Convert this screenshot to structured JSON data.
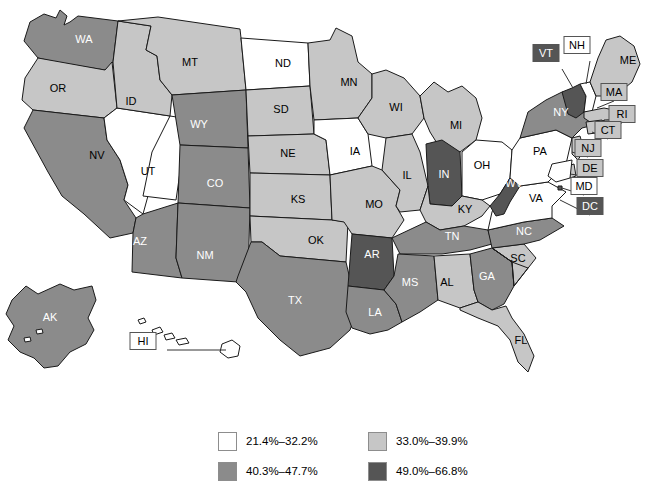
{
  "figure": {
    "type": "choropleth-map",
    "region": "United States"
  },
  "colors": {
    "bin1": "#ffffff",
    "bin2": "#c6c6c6",
    "bin3": "#8b8b8b",
    "bin4": "#555555",
    "outline": "#1a1a1a",
    "background": "#ffffff",
    "callout_border": "#555555",
    "label_dark_text": "#000000",
    "label_light_text": "#ffffff"
  },
  "legend": {
    "items": [
      {
        "label": "21.4%–32.2%",
        "color_key": "bin1",
        "bin": 1
      },
      {
        "label": "33.0%–39.9%",
        "color_key": "bin2",
        "bin": 2
      },
      {
        "label": "40.3%–47.7%",
        "color_key": "bin3",
        "bin": 3
      },
      {
        "label": "49.0%–66.8%",
        "color_key": "bin4",
        "bin": 4
      }
    ]
  },
  "chart_data": {
    "type": "heatmap",
    "title": "",
    "xlabel": "",
    "ylabel": "",
    "legend_position": "bottom",
    "bins": [
      {
        "bin": 1,
        "label": "21.4%–32.2%",
        "min": 21.4,
        "max": 32.2,
        "color": "#ffffff"
      },
      {
        "bin": 2,
        "label": "33.0%–39.9%",
        "min": 33.0,
        "max": 39.9,
        "color": "#c6c6c6"
      },
      {
        "bin": 3,
        "label": "40.3%–47.7%",
        "min": 40.3,
        "max": 47.7,
        "color": "#8b8b8b"
      },
      {
        "bin": 4,
        "label": "49.0%–66.8%",
        "min": 49.0,
        "max": 66.8,
        "color": "#555555"
      }
    ],
    "categories": [
      "WA",
      "OR",
      "CA",
      "NV",
      "ID",
      "MT",
      "WY",
      "UT",
      "AZ",
      "CO",
      "NM",
      "ND",
      "SD",
      "NE",
      "KS",
      "OK",
      "TX",
      "MN",
      "IA",
      "MO",
      "AR",
      "LA",
      "WI",
      "IL",
      "MI",
      "IN",
      "OH",
      "KY",
      "TN",
      "MS",
      "AL",
      "GA",
      "FL",
      "SC",
      "NC",
      "VA",
      "WV",
      "PA",
      "NY",
      "VT",
      "NH",
      "ME",
      "MA",
      "RI",
      "CT",
      "NJ",
      "DE",
      "MD",
      "DC",
      "AK",
      "HI"
    ],
    "values": [
      3,
      2,
      3,
      1,
      2,
      2,
      3,
      1,
      3,
      3,
      3,
      1,
      2,
      2,
      2,
      2,
      3,
      2,
      1,
      2,
      4,
      3,
      2,
      2,
      2,
      4,
      1,
      2,
      3,
      3,
      2,
      3,
      2,
      2,
      3,
      1,
      4,
      1,
      3,
      4,
      1,
      2,
      2,
      2,
      2,
      2,
      2,
      1,
      4,
      3,
      1
    ],
    "states": [
      {
        "code": "WA",
        "bin": 3
      },
      {
        "code": "OR",
        "bin": 2
      },
      {
        "code": "CA",
        "bin": 3
      },
      {
        "code": "NV",
        "bin": 1
      },
      {
        "code": "ID",
        "bin": 2
      },
      {
        "code": "MT",
        "bin": 2
      },
      {
        "code": "WY",
        "bin": 3
      },
      {
        "code": "UT",
        "bin": 1
      },
      {
        "code": "AZ",
        "bin": 3
      },
      {
        "code": "CO",
        "bin": 3
      },
      {
        "code": "NM",
        "bin": 3
      },
      {
        "code": "ND",
        "bin": 1
      },
      {
        "code": "SD",
        "bin": 2
      },
      {
        "code": "NE",
        "bin": 2
      },
      {
        "code": "KS",
        "bin": 2
      },
      {
        "code": "OK",
        "bin": 2
      },
      {
        "code": "TX",
        "bin": 3
      },
      {
        "code": "MN",
        "bin": 2
      },
      {
        "code": "IA",
        "bin": 1
      },
      {
        "code": "MO",
        "bin": 2
      },
      {
        "code": "AR",
        "bin": 4
      },
      {
        "code": "LA",
        "bin": 3
      },
      {
        "code": "WI",
        "bin": 2
      },
      {
        "code": "IL",
        "bin": 2
      },
      {
        "code": "MI",
        "bin": 2
      },
      {
        "code": "IN",
        "bin": 4
      },
      {
        "code": "OH",
        "bin": 1
      },
      {
        "code": "KY",
        "bin": 2
      },
      {
        "code": "TN",
        "bin": 3
      },
      {
        "code": "MS",
        "bin": 3
      },
      {
        "code": "AL",
        "bin": 2
      },
      {
        "code": "GA",
        "bin": 3
      },
      {
        "code": "FL",
        "bin": 2
      },
      {
        "code": "SC",
        "bin": 2
      },
      {
        "code": "NC",
        "bin": 3
      },
      {
        "code": "VA",
        "bin": 1
      },
      {
        "code": "WV",
        "bin": 4
      },
      {
        "code": "PA",
        "bin": 1
      },
      {
        "code": "NY",
        "bin": 3
      },
      {
        "code": "VT",
        "bin": 4
      },
      {
        "code": "NH",
        "bin": 1
      },
      {
        "code": "ME",
        "bin": 2
      },
      {
        "code": "MA",
        "bin": 2
      },
      {
        "code": "RI",
        "bin": 2
      },
      {
        "code": "CT",
        "bin": 2
      },
      {
        "code": "NJ",
        "bin": 2
      },
      {
        "code": "DE",
        "bin": 2
      },
      {
        "code": "MD",
        "bin": 1
      },
      {
        "code": "DC",
        "bin": 4
      },
      {
        "code": "AK",
        "bin": 3
      },
      {
        "code": "HI",
        "bin": 1
      }
    ]
  },
  "map": {
    "inline_labels": [
      {
        "code": "WA",
        "x": 84,
        "y": 40,
        "bin": 3
      },
      {
        "code": "OR",
        "x": 58,
        "y": 89,
        "bin": 2
      },
      {
        "code": "ID",
        "x": 131,
        "y": 102,
        "bin": 2
      },
      {
        "code": "CA",
        "x": 47,
        "y": 186,
        "bin": 3
      },
      {
        "code": "NV",
        "x": 97,
        "y": 156,
        "bin": 1
      },
      {
        "code": "UT",
        "x": 148,
        "y": 172,
        "bin": 1
      },
      {
        "code": "MT",
        "x": 190,
        "y": 63,
        "bin": 2
      },
      {
        "code": "WY",
        "x": 199,
        "y": 125,
        "bin": 3
      },
      {
        "code": "CO",
        "x": 215,
        "y": 184,
        "bin": 3
      },
      {
        "code": "AZ",
        "x": 140,
        "y": 242,
        "bin": 3
      },
      {
        "code": "NM",
        "x": 205,
        "y": 256,
        "bin": 3
      },
      {
        "code": "ND",
        "x": 283,
        "y": 64,
        "bin": 1
      },
      {
        "code": "SD",
        "x": 281,
        "y": 110,
        "bin": 2
      },
      {
        "code": "NE",
        "x": 288,
        "y": 154,
        "bin": 2
      },
      {
        "code": "KS",
        "x": 298,
        "y": 200,
        "bin": 2
      },
      {
        "code": "OK",
        "x": 316,
        "y": 241,
        "bin": 2
      },
      {
        "code": "TX",
        "x": 295,
        "y": 301,
        "bin": 3
      },
      {
        "code": "MN",
        "x": 349,
        "y": 83,
        "bin": 2
      },
      {
        "code": "IA",
        "x": 355,
        "y": 152,
        "bin": 1
      },
      {
        "code": "MO",
        "x": 374,
        "y": 205,
        "bin": 2
      },
      {
        "code": "AR",
        "x": 372,
        "y": 255,
        "bin": 4
      },
      {
        "code": "LA",
        "x": 375,
        "y": 313,
        "bin": 3
      },
      {
        "code": "WI",
        "x": 396,
        "y": 108,
        "bin": 2
      },
      {
        "code": "IL",
        "x": 407,
        "y": 176,
        "bin": 2
      },
      {
        "code": "MI",
        "x": 456,
        "y": 126,
        "bin": 2
      },
      {
        "code": "IN",
        "x": 444,
        "y": 175,
        "bin": 4
      },
      {
        "code": "OH",
        "x": 482,
        "y": 166,
        "bin": 1
      },
      {
        "code": "KY",
        "x": 465,
        "y": 210,
        "bin": 2
      },
      {
        "code": "TN",
        "x": 452,
        "y": 237,
        "bin": 3
      },
      {
        "code": "MS",
        "x": 410,
        "y": 283,
        "bin": 3
      },
      {
        "code": "AL",
        "x": 447,
        "y": 283,
        "bin": 2
      },
      {
        "code": "GA",
        "x": 487,
        "y": 277,
        "bin": 3
      },
      {
        "code": "FL",
        "x": 521,
        "y": 341,
        "bin": 2
      },
      {
        "code": "SC",
        "x": 518,
        "y": 259,
        "bin": 2
      },
      {
        "code": "NC",
        "x": 524,
        "y": 232,
        "bin": 3
      },
      {
        "code": "VA",
        "x": 536,
        "y": 199,
        "bin": 1
      },
      {
        "code": "WV",
        "x": 514,
        "y": 184,
        "bin": 4
      },
      {
        "code": "PA",
        "x": 540,
        "y": 152,
        "bin": 1
      },
      {
        "code": "NY",
        "x": 561,
        "y": 113,
        "bin": 3
      },
      {
        "code": "ME",
        "x": 628,
        "y": 61,
        "bin": 2
      },
      {
        "code": "AK",
        "x": 50,
        "y": 318,
        "bin": 3
      }
    ],
    "callouts": [
      {
        "code": "VT",
        "box_x": 546,
        "box_y": 53,
        "bin": 4,
        "line": [
          562,
          69,
          573,
          88
        ]
      },
      {
        "code": "NH",
        "box_x": 577,
        "box_y": 45,
        "bin": 1,
        "line": [
          590,
          61,
          586,
          84
        ]
      },
      {
        "code": "MA",
        "box_x": 614,
        "box_y": 92,
        "bin": 2,
        "line": [
          614,
          101,
          597,
          108
        ]
      },
      {
        "code": "RI",
        "box_x": 622,
        "box_y": 114,
        "bin": 2,
        "line": [
          622,
          123,
          600,
          124
        ]
      },
      {
        "code": "CT",
        "box_x": 608,
        "box_y": 130,
        "bin": 2,
        "line": [
          608,
          139,
          592,
          132
        ]
      },
      {
        "code": "NJ",
        "box_x": 588,
        "box_y": 148,
        "bin": 2,
        "line": [
          588,
          157,
          572,
          152
        ]
      },
      {
        "code": "DE",
        "box_x": 590,
        "box_y": 168,
        "bin": 2,
        "line": [
          590,
          177,
          570,
          174
        ]
      },
      {
        "code": "MD",
        "box_x": 584,
        "box_y": 186,
        "bin": 1,
        "line": [
          584,
          195,
          562,
          188
        ]
      },
      {
        "code": "DC",
        "box_x": 590,
        "box_y": 206,
        "bin": 4,
        "line": [
          590,
          215,
          560,
          200
        ]
      },
      {
        "code": "HI",
        "box_x": 143,
        "box_y": 341,
        "bin": 1,
        "line": [
          167,
          350,
          226,
          350
        ]
      }
    ]
  }
}
